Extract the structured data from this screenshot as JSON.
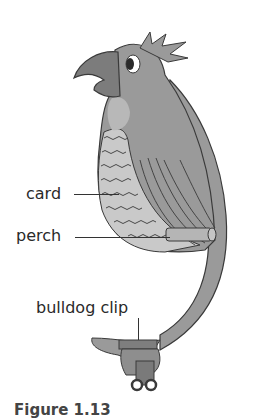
{
  "figure": {
    "labels": {
      "card": "card",
      "perch": "perch",
      "clip": "bulldog clip"
    },
    "caption": "Figure 1.13"
  },
  "colors": {
    "body": "#9a9a9a",
    "beak": "#7c7c7c",
    "chest_light": "#c9c9c9",
    "chest_mid": "#a9a9a9",
    "outline": "#3a3a3a",
    "perch": "#b5b5b5",
    "clip": "#8e8e8e"
  }
}
